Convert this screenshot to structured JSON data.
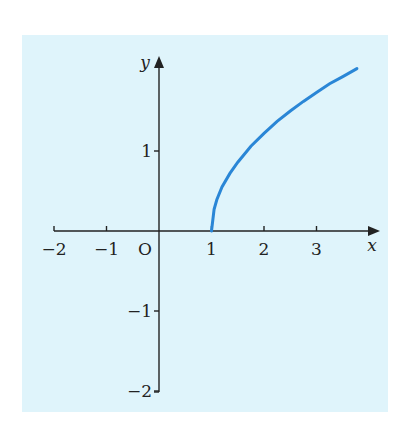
{
  "chart_data": {
    "type": "line",
    "title": "",
    "xlabel": "x",
    "ylabel": "y",
    "origin_label": "O",
    "x_ticks": [
      -2,
      -1,
      1,
      2,
      3
    ],
    "x_tick_labels": [
      "−2",
      "−1",
      "1",
      "2",
      "3"
    ],
    "y_ticks": [
      1,
      -1,
      -2
    ],
    "y_tick_labels": [
      "1",
      "−1",
      "−2"
    ],
    "xlim": [
      -2,
      3.9
    ],
    "ylim": [
      -2,
      2.3
    ],
    "grid": false,
    "background_color": "#dff4fb",
    "series": [
      {
        "name": "curve",
        "color": "#2a86d6",
        "x": [
          1.0,
          1.05,
          1.1,
          1.2,
          1.35,
          1.5,
          1.75,
          2.0,
          2.25,
          2.5,
          2.75,
          3.0,
          3.25,
          3.5,
          3.77
        ],
        "y": [
          0.0,
          0.27,
          0.39,
          0.55,
          0.72,
          0.86,
          1.06,
          1.22,
          1.37,
          1.5,
          1.62,
          1.73,
          1.84,
          1.93,
          2.03
        ]
      }
    ]
  }
}
